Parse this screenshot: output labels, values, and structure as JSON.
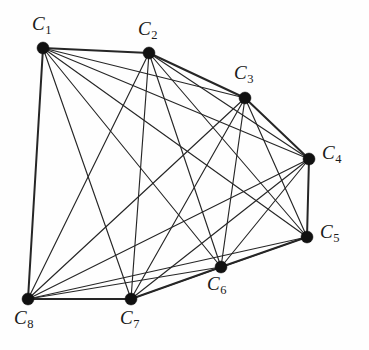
{
  "figure": {
    "background_color": "#fefefe",
    "edge_color": "#262626",
    "vertex_color": "#111111",
    "width": 369,
    "height": 350
  },
  "graph": {
    "vertex_count": 8,
    "edge_count": 28,
    "vertices": [
      {
        "id": "C1",
        "letter": "C",
        "index": "1",
        "x": 43,
        "y": 48,
        "label_x": 32,
        "label_y": 14,
        "r": 6.0
      },
      {
        "id": "C2",
        "letter": "C",
        "index": "2",
        "x": 149,
        "y": 53,
        "label_x": 138,
        "label_y": 19,
        "r": 6.0
      },
      {
        "id": "C3",
        "letter": "C",
        "index": "3",
        "x": 245,
        "y": 98,
        "label_x": 234,
        "label_y": 63,
        "r": 6.0
      },
      {
        "id": "C4",
        "letter": "C",
        "index": "4",
        "x": 309,
        "y": 159,
        "label_x": 322,
        "label_y": 143,
        "r": 6.0
      },
      {
        "id": "C5",
        "letter": "C",
        "index": "5",
        "x": 307,
        "y": 237,
        "label_x": 320,
        "label_y": 222,
        "r": 6.0
      },
      {
        "id": "C6",
        "letter": "C",
        "index": "6",
        "x": 221,
        "y": 267,
        "label_x": 207,
        "label_y": 274,
        "r": 6.0
      },
      {
        "id": "C7",
        "letter": "C",
        "index": "7",
        "x": 131,
        "y": 299,
        "label_x": 120,
        "label_y": 308,
        "r": 6.0
      },
      {
        "id": "C8",
        "letter": "C",
        "index": "8",
        "x": 28,
        "y": 299,
        "label_x": 14,
        "label_y": 308,
        "r": 6.0
      }
    ],
    "edges": [
      {
        "from": "C1",
        "to": "C2",
        "hull": true
      },
      {
        "from": "C1",
        "to": "C3",
        "hull": false
      },
      {
        "from": "C1",
        "to": "C4",
        "hull": false
      },
      {
        "from": "C1",
        "to": "C5",
        "hull": false
      },
      {
        "from": "C1",
        "to": "C6",
        "hull": false
      },
      {
        "from": "C1",
        "to": "C7",
        "hull": false
      },
      {
        "from": "C1",
        "to": "C8",
        "hull": true
      },
      {
        "from": "C2",
        "to": "C3",
        "hull": true
      },
      {
        "from": "C2",
        "to": "C4",
        "hull": false
      },
      {
        "from": "C2",
        "to": "C5",
        "hull": false
      },
      {
        "from": "C2",
        "to": "C6",
        "hull": false
      },
      {
        "from": "C2",
        "to": "C7",
        "hull": false
      },
      {
        "from": "C2",
        "to": "C8",
        "hull": false
      },
      {
        "from": "C3",
        "to": "C4",
        "hull": true
      },
      {
        "from": "C3",
        "to": "C5",
        "hull": false
      },
      {
        "from": "C3",
        "to": "C6",
        "hull": false
      },
      {
        "from": "C3",
        "to": "C7",
        "hull": false
      },
      {
        "from": "C3",
        "to": "C8",
        "hull": false
      },
      {
        "from": "C4",
        "to": "C5",
        "hull": true
      },
      {
        "from": "C4",
        "to": "C6",
        "hull": false
      },
      {
        "from": "C4",
        "to": "C7",
        "hull": false
      },
      {
        "from": "C4",
        "to": "C8",
        "hull": false
      },
      {
        "from": "C5",
        "to": "C6",
        "hull": true
      },
      {
        "from": "C5",
        "to": "C7",
        "hull": false
      },
      {
        "from": "C5",
        "to": "C8",
        "hull": false
      },
      {
        "from": "C6",
        "to": "C7",
        "hull": true
      },
      {
        "from": "C6",
        "to": "C8",
        "hull": false
      },
      {
        "from": "C7",
        "to": "C8",
        "hull": true
      }
    ]
  }
}
